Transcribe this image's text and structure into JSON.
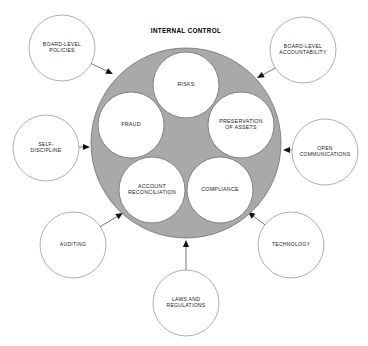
{
  "diagram": {
    "title": "INTERNAL CONTROL",
    "hub": {
      "name": "internal-control-hub",
      "fill_color": "#a9a9a9",
      "stroke_color": "#6e6e6e",
      "center": {
        "x": 186,
        "y": 143
      },
      "radius": 95
    },
    "inner_circles": [
      {
        "id": "risks",
        "lines": [
          "RISKS"
        ],
        "cx": 186,
        "cy": 85,
        "r": 33
      },
      {
        "id": "preservation-of-assets",
        "lines": [
          "PRESERVATION",
          "OF ASSETS"
        ],
        "cx": 241,
        "cy": 125,
        "r": 33
      },
      {
        "id": "compliance",
        "lines": [
          "COMPLIANCE"
        ],
        "cx": 220,
        "cy": 190,
        "r": 33
      },
      {
        "id": "account-reconciliation",
        "lines": [
          "ACCOUNT",
          "RECONCILIATION"
        ],
        "cx": 152,
        "cy": 190,
        "r": 33
      },
      {
        "id": "fraud",
        "lines": [
          "FRAUD"
        ],
        "cx": 131,
        "cy": 125,
        "r": 33
      }
    ],
    "satellites": [
      {
        "id": "board-level-policies",
        "lines": [
          "BOARD-LEVEL",
          "POLICIES"
        ],
        "cx": 62,
        "cy": 48,
        "r": 33,
        "arrow_to": {
          "x": 113,
          "y": 74
        },
        "line_from": {
          "x": 88,
          "y": 62
        }
      },
      {
        "id": "board-level-accountability",
        "lines": [
          "BOARD-LEVEL",
          "ACCOUNTABILITY"
        ],
        "cx": 303,
        "cy": 50,
        "r": 33,
        "arrow_to": {
          "x": 257,
          "y": 78
        },
        "line_from": {
          "x": 279,
          "y": 66
        }
      },
      {
        "id": "self-discipline",
        "lines": [
          "SELF-",
          "DISCIPLINE"
        ],
        "cx": 46,
        "cy": 148,
        "r": 33,
        "arrow_to": {
          "x": 90,
          "y": 147
        },
        "line_from": {
          "x": 79,
          "y": 147
        }
      },
      {
        "id": "open-communications",
        "lines": [
          "OPEN",
          "COMMUNICATIONS"
        ],
        "cx": 325,
        "cy": 152,
        "r": 33,
        "arrow_to": {
          "x": 283,
          "y": 150
        },
        "line_from": {
          "x": 292,
          "y": 150
        }
      },
      {
        "id": "auditing",
        "lines": [
          "AUDITING"
        ],
        "cx": 73,
        "cy": 245,
        "r": 33,
        "arrow_to": {
          "x": 123,
          "y": 213
        },
        "line_from": {
          "x": 98,
          "y": 228
        }
      },
      {
        "id": "technology",
        "lines": [
          "TECHNOLOGY"
        ],
        "cx": 291,
        "cy": 245,
        "r": 33,
        "arrow_to": {
          "x": 248,
          "y": 212
        },
        "line_from": {
          "x": 269,
          "y": 228
        }
      },
      {
        "id": "laws-and-regulations",
        "lines": [
          "LAWS AND",
          "REGULATIONS"
        ],
        "cx": 186,
        "cy": 303,
        "r": 33,
        "arrow_to": {
          "x": 186,
          "y": 240
        },
        "line_from": {
          "x": 186,
          "y": 270
        }
      }
    ]
  }
}
